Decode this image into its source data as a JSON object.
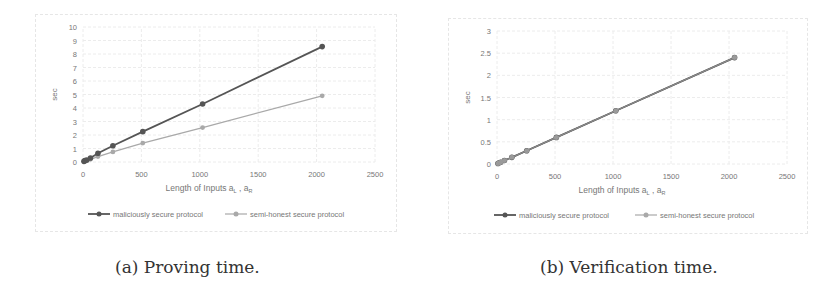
{
  "figures": [
    {
      "caption": "(a) Proving time.",
      "legend": [
        "maliciously secure protocol",
        "semi-honest secure protocol"
      ]
    },
    {
      "caption": "(b) Verification time.",
      "legend": [
        "maliciously secure protocol",
        "semi-honest secure protocol"
      ]
    }
  ],
  "colors": {
    "malicious": "#555555",
    "semi_honest": "#a9a9a9",
    "grid": "#ececec",
    "text": "#777777"
  },
  "chart_data": [
    {
      "type": "line",
      "title": "(a) Proving time.",
      "xlabel": "Length of Inputs a_L , a_R",
      "ylabel": "sec",
      "xlim": [
        0,
        2500
      ],
      "ylim": [
        0,
        10
      ],
      "xticks": [
        0,
        500,
        1000,
        1500,
        2000,
        2500
      ],
      "yticks": [
        0,
        1,
        2,
        3,
        4,
        5,
        6,
        7,
        8,
        9,
        10
      ],
      "grid": true,
      "legend_position": "bottom",
      "x": [
        8,
        16,
        32,
        64,
        128,
        256,
        512,
        1024,
        2048
      ],
      "series": [
        {
          "name": "maliciously secure protocol",
          "values": [
            0.05,
            0.1,
            0.15,
            0.3,
            0.65,
            1.2,
            2.25,
            4.3,
            8.55
          ]
        },
        {
          "name": "semi-honest secure protocol",
          "values": [
            0.03,
            0.06,
            0.1,
            0.2,
            0.4,
            0.75,
            1.4,
            2.55,
            4.9
          ]
        }
      ]
    },
    {
      "type": "line",
      "title": "(b) Verification time.",
      "xlabel": "Length of Inputs a_L , a_R",
      "ylabel": "sec",
      "xlim": [
        0,
        2500
      ],
      "ylim": [
        0,
        3
      ],
      "xticks": [
        0,
        500,
        1000,
        1500,
        2000,
        2500
      ],
      "yticks": [
        0,
        0.5,
        1,
        1.5,
        2,
        2.5,
        3
      ],
      "grid": true,
      "legend_position": "bottom",
      "x": [
        8,
        16,
        32,
        64,
        128,
        256,
        512,
        1024,
        2048
      ],
      "series": [
        {
          "name": "maliciously secure protocol",
          "values": [
            0.01,
            0.02,
            0.04,
            0.08,
            0.15,
            0.3,
            0.6,
            1.2,
            2.4
          ]
        },
        {
          "name": "semi-honest secure protocol",
          "values": [
            0.01,
            0.02,
            0.04,
            0.08,
            0.15,
            0.3,
            0.6,
            1.2,
            2.4
          ]
        }
      ]
    }
  ]
}
